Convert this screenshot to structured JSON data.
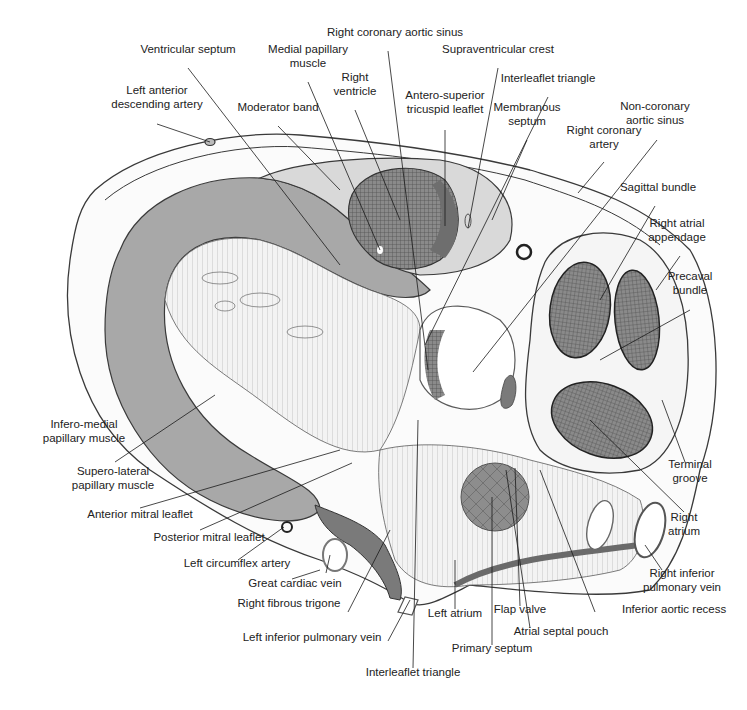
{
  "figure": {
    "colors": {
      "background": "#ffffff",
      "myocardium_gray": "#a8a8a8",
      "light_gray": "#d9d9d9",
      "dark_hatch": "#6e6e6e",
      "outline": "#3a3a3a",
      "text": "#222222"
    }
  },
  "labels": [
    {
      "id": "ventricular-septum",
      "text": "Ventricular septum",
      "x": 188,
      "y": 52,
      "align": "center",
      "line": [
        188,
        68,
        340,
        265
      ]
    },
    {
      "id": "left-anterior-descending-artery",
      "text": "Left anterior\ndescending artery",
      "x": 157,
      "y": 93,
      "align": "center",
      "line": [
        157,
        124,
        210,
        142
      ]
    },
    {
      "id": "medial-papillary-muscle",
      "text": "Medial papillary\nmuscle",
      "x": 308,
      "y": 52,
      "align": "center",
      "line": [
        308,
        82,
        380,
        250
      ]
    },
    {
      "id": "right-ventricle",
      "text": "Right\nventricle",
      "x": 355,
      "y": 80,
      "align": "center",
      "line": [
        355,
        110,
        400,
        220
      ]
    },
    {
      "id": "moderator-band",
      "text": "Moderator band",
      "x": 278,
      "y": 110,
      "align": "center",
      "line": [
        278,
        126,
        340,
        190
      ]
    },
    {
      "id": "right-coronary-aortic-sinus",
      "text": "Right coronary aortic sinus",
      "x": 395,
      "y": 35,
      "align": "center",
      "line": [
        388,
        51,
        428,
        370
      ]
    },
    {
      "id": "supraventricular-crest",
      "text": "Supraventricular crest",
      "x": 498,
      "y": 52,
      "align": "center",
      "line": [
        498,
        68,
        468,
        228
      ]
    },
    {
      "id": "antero-superior-tricuspid-leaflet",
      "text": "Antero-superior\ntricuspid leaflet",
      "x": 445,
      "y": 98,
      "align": "center",
      "line": [
        445,
        130,
        445,
        226
      ]
    },
    {
      "id": "interleaflet-triangle-top",
      "text": "Interleaflet triangle",
      "x": 548,
      "y": 81,
      "align": "center",
      "line": [
        548,
        97,
        425,
        345
      ]
    },
    {
      "id": "membranous-septum",
      "text": "Membranous\nseptum",
      "x": 527,
      "y": 110,
      "align": "center",
      "line": [
        527,
        140,
        492,
        220
      ]
    },
    {
      "id": "non-coronary-aortic-sinus",
      "text": "Non-coronary\naortic sinus",
      "x": 655,
      "y": 109,
      "align": "center",
      "line": [
        657,
        140,
        473,
        372
      ]
    },
    {
      "id": "right-coronary-artery",
      "text": "Right coronary\nartery",
      "x": 604,
      "y": 133,
      "align": "center",
      "line": [
        604,
        162,
        578,
        193
      ]
    },
    {
      "id": "sagittal-bundle",
      "text": "Sagittal bundle",
      "x": 658,
      "y": 190,
      "align": "center",
      "line": [
        655,
        206,
        600,
        300
      ]
    },
    {
      "id": "right-atrial-appendage",
      "text": "Right atrial\nappendage",
      "x": 677,
      "y": 226,
      "align": "center",
      "line": [
        680,
        256,
        656,
        290
      ]
    },
    {
      "id": "precaval-bundle",
      "text": "Precaval\nbundle",
      "x": 690,
      "y": 279,
      "align": "center",
      "line": [
        690,
        310,
        600,
        360
      ]
    },
    {
      "id": "terminal-groove",
      "text": "Terminal\ngroove",
      "x": 690,
      "y": 467,
      "align": "center",
      "line": [
        685,
        462,
        662,
        400
      ]
    },
    {
      "id": "right-atrium",
      "text": "Right\natrium",
      "x": 684,
      "y": 520,
      "align": "center",
      "line": [
        684,
        512,
        590,
        420
      ]
    },
    {
      "id": "right-inferior-pulmonary-vein",
      "text": "Right inferior\npulmonary vein",
      "x": 682,
      "y": 576,
      "align": "center",
      "line": [
        662,
        570,
        645,
        545
      ]
    },
    {
      "id": "inferior-aortic-recess",
      "text": "Inferior aortic recess",
      "x": 622,
      "y": 612,
      "align": "start",
      "line": [
        595,
        612,
        540,
        470
      ]
    },
    {
      "id": "atrial-septal-pouch",
      "text": "Atrial septal pouch",
      "x": 561,
      "y": 634,
      "align": "center",
      "line": [
        530,
        628,
        506,
        470
      ]
    },
    {
      "id": "flap-valve",
      "text": "Flap valve",
      "x": 520,
      "y": 612,
      "align": "center",
      "line": [
        520,
        606,
        515,
        468
      ]
    },
    {
      "id": "primary-septum",
      "text": "Primary septum",
      "x": 492,
      "y": 651,
      "align": "center",
      "line": [
        492,
        645,
        492,
        497
      ]
    },
    {
      "id": "left-atrium",
      "text": "Left atrium",
      "x": 455,
      "y": 616,
      "align": "center",
      "line": [
        455,
        609,
        455,
        560
      ]
    },
    {
      "id": "interleaflet-triangle-bottom",
      "text": "Interleaflet triangle",
      "x": 413,
      "y": 675,
      "align": "center",
      "line": [
        413,
        668,
        418,
        420
      ]
    },
    {
      "id": "left-inferior-pulmonary-vein",
      "text": "Left inferior pulmonary vein",
      "x": 312,
      "y": 640,
      "align": "center",
      "line": [
        388,
        641,
        410,
        600
      ]
    },
    {
      "id": "right-fibrous-trigone",
      "text": "Right fibrous trigone",
      "x": 289,
      "y": 606,
      "align": "center",
      "line": [
        348,
        612,
        390,
        530
      ]
    },
    {
      "id": "great-cardiac-vein",
      "text": "Great cardiac vein",
      "x": 295,
      "y": 586,
      "align": "center",
      "line": [
        326,
        573,
        330,
        555
      ]
    },
    {
      "id": "left-circumflex-artery",
      "text": "Left circumflex artery",
      "x": 237,
      "y": 566,
      "align": "center",
      "line": [
        292,
        579,
        320,
        570
      ]
    },
    {
      "id": "posterior-mitral-leaflet",
      "text": "Posterior mitral leaflet",
      "x": 209,
      "y": 540,
      "align": "center",
      "line": [
        238,
        560,
        284,
        527
      ]
    },
    {
      "id": "anterior-mitral-leaflet",
      "text": "Anterior mitral leaflet",
      "x": 140,
      "y": 517,
      "align": "center",
      "line": [
        200,
        530,
        352,
        463
      ]
    },
    {
      "id": "supero-lateral-papillary-muscle",
      "text": "Supero-lateral\npapillary muscle",
      "x": 113,
      "y": 474,
      "align": "center",
      "line": [
        140,
        508,
        340,
        450
      ]
    },
    {
      "id": "infero-medial-papillary-muscle",
      "text": "Infero-medial\npapillary muscle",
      "x": 84,
      "y": 427,
      "align": "center",
      "line": [
        115,
        462,
        215,
        395
      ]
    }
  ]
}
